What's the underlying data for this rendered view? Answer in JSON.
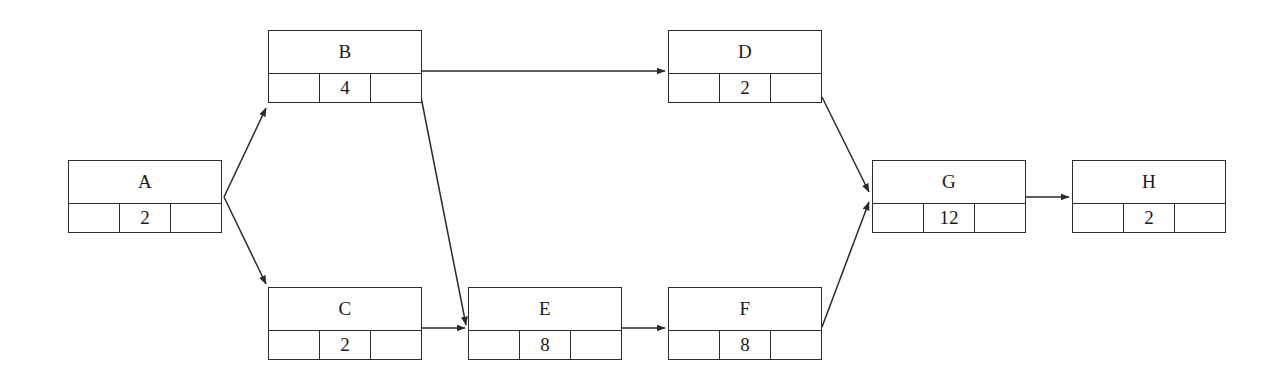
{
  "diagram": {
    "type": "activity-network-diagram",
    "title": "",
    "stroke_color": "#2b2b2b",
    "background_color": "#ffffff",
    "nodes": [
      {
        "id": "A",
        "label": "A",
        "left_cell": "",
        "duration": "2",
        "right_cell": "",
        "x": 68,
        "y": 160,
        "w": 154,
        "h": 73
      },
      {
        "id": "B",
        "label": "B",
        "left_cell": "",
        "duration": "4",
        "right_cell": "",
        "x": 268,
        "y": 30,
        "w": 154,
        "h": 73
      },
      {
        "id": "C",
        "label": "C",
        "left_cell": "",
        "duration": "2",
        "right_cell": "",
        "x": 268,
        "y": 287,
        "w": 154,
        "h": 73
      },
      {
        "id": "D",
        "label": "D",
        "left_cell": "",
        "duration": "2",
        "right_cell": "",
        "x": 668,
        "y": 30,
        "w": 154,
        "h": 73
      },
      {
        "id": "E",
        "label": "E",
        "left_cell": "",
        "duration": "8",
        "right_cell": "",
        "x": 468,
        "y": 287,
        "w": 154,
        "h": 73
      },
      {
        "id": "F",
        "label": "F",
        "left_cell": "",
        "duration": "8",
        "right_cell": "",
        "x": 668,
        "y": 287,
        "w": 154,
        "h": 73
      },
      {
        "id": "G",
        "label": "G",
        "left_cell": "",
        "duration": "12",
        "right_cell": "",
        "x": 872,
        "y": 160,
        "w": 154,
        "h": 73
      },
      {
        "id": "H",
        "label": "H",
        "left_cell": "",
        "duration": "2",
        "right_cell": "",
        "x": 1072,
        "y": 160,
        "w": 154,
        "h": 73
      }
    ],
    "edges": [
      {
        "from": "A",
        "to": "B",
        "x1": 224,
        "y1": 197,
        "x2": 266,
        "y2": 108
      },
      {
        "from": "A",
        "to": "C",
        "x1": 224,
        "y1": 197,
        "x2": 266,
        "y2": 284
      },
      {
        "from": "B",
        "to": "D",
        "x1": 422,
        "y1": 71,
        "x2": 665,
        "y2": 71
      },
      {
        "from": "B",
        "to": "E",
        "x1": 421,
        "y1": 97,
        "x2": 466,
        "y2": 325
      },
      {
        "from": "C",
        "to": "E",
        "x1": 422,
        "y1": 328,
        "x2": 465,
        "y2": 328
      },
      {
        "from": "E",
        "to": "F",
        "x1": 622,
        "y1": 328,
        "x2": 665,
        "y2": 328
      },
      {
        "from": "D",
        "to": "G",
        "x1": 822,
        "y1": 97,
        "x2": 869,
        "y2": 192
      },
      {
        "from": "F",
        "to": "G",
        "x1": 822,
        "y1": 327,
        "x2": 869,
        "y2": 202
      },
      {
        "from": "G",
        "to": "H",
        "x1": 1026,
        "y1": 197,
        "x2": 1069,
        "y2": 197
      }
    ]
  }
}
